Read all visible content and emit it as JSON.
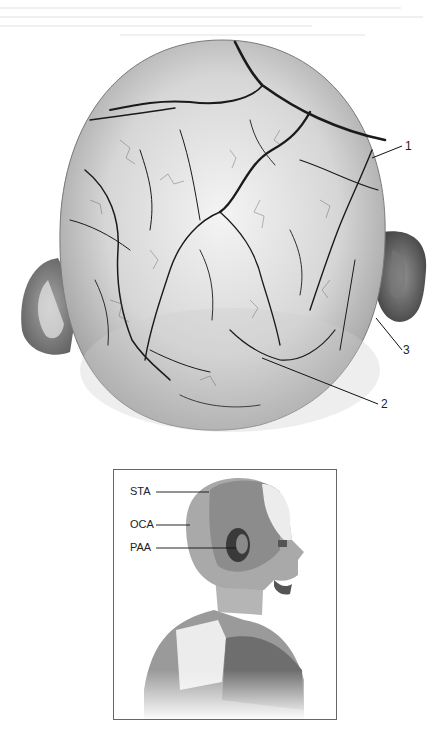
{
  "figure": {
    "main_view": "superior view of scalp arterial network",
    "callouts": [
      {
        "id": "1",
        "label": "1"
      },
      {
        "id": "2",
        "label": "2"
      },
      {
        "id": "3",
        "label": "3"
      }
    ]
  },
  "inset": {
    "labels": [
      {
        "id": "sta",
        "label": "STA"
      },
      {
        "id": "oca",
        "label": "OCA"
      },
      {
        "id": "paa",
        "label": "PAA"
      }
    ],
    "colors": {
      "sta": "#8a8a8a",
      "oca": "#a8a8a8",
      "paa": "#3a3a3a",
      "skin_light": "#d8d8d8",
      "white_patch": "#f2f2f2"
    }
  }
}
